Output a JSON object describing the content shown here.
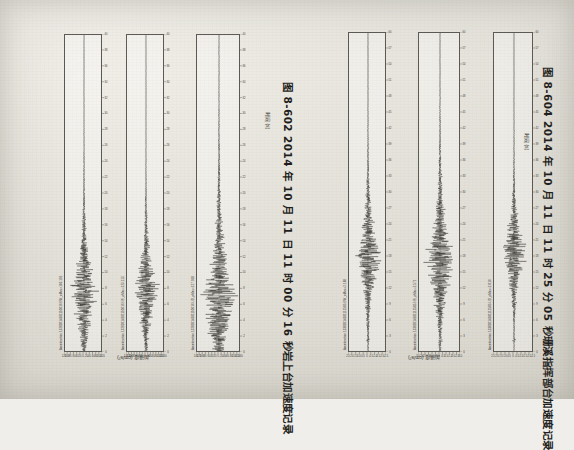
{
  "page": {
    "orientation": "rotated-90-clockwise",
    "background_color": "#efeeea",
    "ink_color": "#2e2c29"
  },
  "figures": [
    {
      "id": "fig-8-602",
      "caption": "图 8-602   2014 年 10 月 11 日 11 时 00 分 16 秒岩上台加速度记录",
      "caption_number": "图 8-602",
      "caption_text": "2014 年 10 月 11 日 11 时 00 分 16 秒岩上台加速度记录",
      "xlabel": "时间 (s)",
      "ylabel": "加速度 (cm/s²)",
      "panels": [
        {
          "trace_title": "Acceleration 13202014101110016 EW_aMax=105.191",
          "component": "EW",
          "amax": "105.191",
          "ylim": [
            -120,
            120
          ],
          "yticks": [
            "-120",
            "-100",
            "-80",
            "-60",
            "-40",
            "-20",
            "0",
            "20",
            "40",
            "60",
            "80",
            "100",
            "120"
          ],
          "xlim": [
            0,
            40
          ],
          "xticks": [
            "0",
            "2",
            "4",
            "6",
            "8",
            "10",
            "12",
            "14",
            "16",
            "18",
            "20",
            "22",
            "24",
            "26",
            "28",
            "30",
            "32",
            "34",
            "36",
            "38",
            "40"
          ],
          "burst_center": 9.2,
          "burst_width": 3.4,
          "peak_rel": 1.0,
          "seed": 101
        },
        {
          "trace_title": "Acceleration 13202014101110016 NS_aMax=123.113",
          "component": "NS",
          "amax": "123.113",
          "ylim": [
            -140,
            140
          ],
          "yticks": [
            "-140",
            "-120",
            "-100",
            "-80",
            "-60",
            "-40",
            "-20",
            "0",
            "20",
            "40",
            "60",
            "80",
            "100",
            "120",
            "140"
          ],
          "xlim": [
            0,
            40
          ],
          "xticks": [
            "0",
            "2",
            "4",
            "6",
            "8",
            "10",
            "12",
            "14",
            "16",
            "18",
            "20",
            "22",
            "24",
            "26",
            "28",
            "30",
            "32",
            "34",
            "36",
            "38",
            "40"
          ],
          "burst_center": 9.4,
          "burst_width": 3.1,
          "peak_rel": 0.94,
          "seed": 202
        },
        {
          "trace_title": "Acceleration 13202014101110016 UD_aMax=127.910",
          "component": "UD",
          "amax": "127.910",
          "ylim": [
            -140,
            140
          ],
          "yticks": [
            "-140",
            "-120",
            "-100",
            "-80",
            "-60",
            "-40",
            "-20",
            "0",
            "20",
            "40",
            "60",
            "80",
            "100",
            "120",
            "140"
          ],
          "xlim": [
            0,
            40
          ],
          "xticks": [
            "0",
            "2",
            "4",
            "6",
            "8",
            "10",
            "12",
            "14",
            "16",
            "18",
            "20",
            "22",
            "24",
            "26",
            "28",
            "30",
            "32",
            "34",
            "36",
            "38",
            "40"
          ],
          "burst_center": 9.0,
          "burst_width": 4.6,
          "peak_rel": 1.0,
          "seed": 303
        }
      ]
    },
    {
      "id": "fig-8-604",
      "caption": "图 8-604   2014 年 10 月 11 日 11 时 25 分 05 秒珊溪指挥部台加速度记录",
      "caption_number": "图 8-604",
      "caption_text": "2014 年 10 月 11 日 11 时 25 分 05 秒珊溪指挥部台加速度记录",
      "xlabel": "时间 (s)",
      "ylabel": "加速度 (cm/s²)",
      "panels": [
        {
          "trace_title": "Acceleration 13302014101112505 EW_aMax=2.160",
          "component": "EW",
          "amax": "2.160",
          "ylim": [
            -2.5,
            2.5
          ],
          "yticks": [
            "-2.5",
            "-2.0",
            "-1.5",
            "-1.0",
            "-0.5",
            "0",
            "0.5",
            "1.0",
            "1.5",
            "2.0",
            "2.5"
          ],
          "xlim": [
            0,
            60
          ],
          "xticks": [
            "0",
            "3",
            "6",
            "9",
            "12",
            "15",
            "18",
            "21",
            "24",
            "27",
            "30",
            "33",
            "36",
            "39",
            "42",
            "45",
            "48",
            "51",
            "54",
            "57",
            "60"
          ],
          "burst_center": 20.5,
          "burst_width": 5.0,
          "peak_rel": 0.9,
          "seed": 404
        },
        {
          "trace_title": "Acceleration 13302014101112505 NS_aMax=2.571",
          "component": "NS",
          "amax": "2.571",
          "ylim": [
            -3.0,
            3.0
          ],
          "yticks": [
            "-3.0",
            "-2.5",
            "-2.0",
            "-1.5",
            "-1.0",
            "-0.5",
            "0",
            "0.5",
            "1.0",
            "1.5",
            "2.0",
            "2.5",
            "3.0"
          ],
          "xlim": [
            0,
            60
          ],
          "xticks": [
            "0",
            "3",
            "6",
            "9",
            "12",
            "15",
            "18",
            "21",
            "24",
            "27",
            "30",
            "33",
            "36",
            "39",
            "42",
            "45",
            "48",
            "51",
            "54",
            "57",
            "60"
          ],
          "burst_center": 20.2,
          "burst_width": 5.6,
          "peak_rel": 1.0,
          "seed": 505
        },
        {
          "trace_title": "Acceleration 13302014101112505 UD_aMax=2.016",
          "component": "UD",
          "amax": "2.016",
          "ylim": [
            -2.5,
            2.5
          ],
          "yticks": [
            "-2.5",
            "-2.0",
            "-1.5",
            "-1.0",
            "-0.5",
            "0",
            "0.5",
            "1.0",
            "1.5",
            "2.0",
            "2.5"
          ],
          "xlim": [
            0,
            60
          ],
          "xticks": [
            "0",
            "3",
            "6",
            "9",
            "12",
            "15",
            "18",
            "21",
            "24",
            "27",
            "30",
            "33",
            "36",
            "39",
            "42",
            "45",
            "48",
            "51",
            "54",
            "57",
            "60"
          ],
          "burst_center": 20.8,
          "burst_width": 4.2,
          "peak_rel": 0.85,
          "seed": 606
        }
      ]
    }
  ],
  "chart_data": {
    "type": "line",
    "xlabel": "时间 (s)",
    "ylabel": "加速度 (cm/s²)",
    "grid": false,
    "legend": "none",
    "series": [
      {
        "name": "13202014101110016 EW",
        "amax": 105.191,
        "ylim": [
          -120,
          120
        ],
        "xlim": [
          0,
          40
        ],
        "peak_time_s": 9.2
      },
      {
        "name": "13202014101110016 NS",
        "amax": 123.113,
        "ylim": [
          -140,
          140
        ],
        "xlim": [
          0,
          40
        ],
        "peak_time_s": 9.4
      },
      {
        "name": "13202014101110016 UD",
        "amax": 127.91,
        "ylim": [
          -140,
          140
        ],
        "xlim": [
          0,
          40
        ],
        "peak_time_s": 9.0
      },
      {
        "name": "13302014101112505 EW",
        "amax": 2.16,
        "ylim": [
          -2.5,
          2.5
        ],
        "xlim": [
          0,
          60
        ],
        "peak_time_s": 20.5
      },
      {
        "name": "13302014101112505 NS",
        "amax": 2.571,
        "ylim": [
          -3.0,
          3.0
        ],
        "xlim": [
          0,
          60
        ],
        "peak_time_s": 20.2
      },
      {
        "name": "13302014101112505 UD",
        "amax": 2.016,
        "ylim": [
          -2.5,
          2.5
        ],
        "xlim": [
          0,
          60
        ],
        "peak_time_s": 20.8
      }
    ]
  }
}
